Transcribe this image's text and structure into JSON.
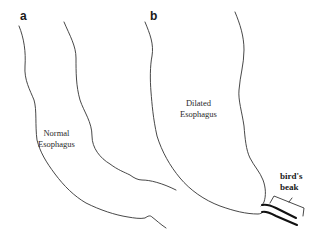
{
  "panels": [
    {
      "id": "a",
      "label": "a",
      "organ_label_line1": "Normal",
      "organ_label_line2": "Esophagus"
    },
    {
      "id": "b",
      "label": "b",
      "organ_label_line1": "Dilated",
      "organ_label_line2": "Esophagus"
    }
  ],
  "annotation": {
    "line1": "bird's",
    "line2": "beak"
  },
  "colors": {
    "line": "#333333",
    "background": "#ffffff"
  }
}
